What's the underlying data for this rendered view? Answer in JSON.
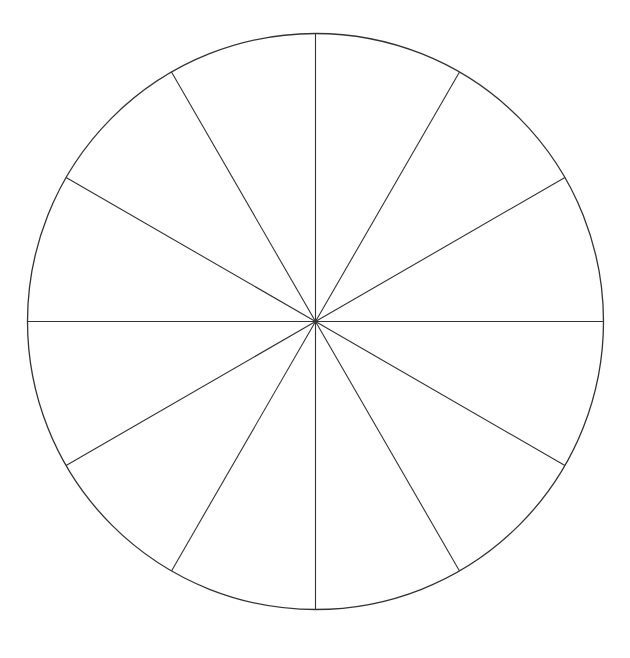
{
  "diagram": {
    "type": "divided-circle",
    "segments": 12,
    "center": [
      315.5,
      321.5
    ],
    "radius": 288,
    "stroke_color": "#333333",
    "background_color": "#ffffff"
  }
}
